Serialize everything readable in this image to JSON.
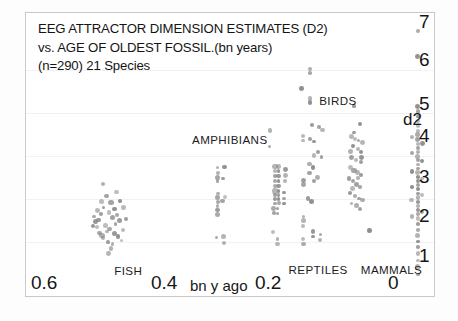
{
  "figure": {
    "title_lines": [
      "EEG ATTRACTOR  DIMENSION ESTIMATES (D2)",
      "vs. AGE OF OLDEST FOSSIL.(bn years)",
      "(n=290) 21 Species"
    ]
  },
  "axes": {
    "y_ticks": [
      "7",
      "6",
      "5",
      "4",
      "3",
      "2",
      "1"
    ],
    "y_axis_label": "d2",
    "x_ticks": [
      "0.6",
      "0.4",
      "0.2",
      "0"
    ],
    "x_axis_title": "bn y ago"
  },
  "group_labels": [
    {
      "name": "FISH",
      "text": "FISH"
    },
    {
      "name": "AMPHIBIANS",
      "text": "AMPHIBIANS"
    },
    {
      "name": "REPTILES",
      "text": "REPTILES"
    },
    {
      "name": "BIRDS",
      "text": "BIRDS"
    },
    {
      "name": "MAMMALS",
      "text": "MAMMALS"
    }
  ],
  "chart_data": {
    "type": "scatter",
    "title": "EEG ATTRACTOR  DIMENSION ESTIMATES (D2) vs. AGE OF OLDEST FOSSIL.(bn years)",
    "subtitle": "(n=290) 21 Species",
    "xlabel": "bn y ago",
    "ylabel": "d2",
    "xlim": [
      0.66,
      -0.02
    ],
    "ylim": [
      0.55,
      7.45
    ],
    "x_reversed": true,
    "grid": "faint-horizontal",
    "legend": "none (in-plot group labels)",
    "n_total": 290,
    "n_species": 21,
    "point_color": "#8a8a8a",
    "series": [
      {
        "name": "FISH",
        "label_x": 0.512,
        "label_y": 1.18,
        "points": [
          [
            0.533,
            3.3
          ],
          [
            0.527,
            3.02
          ],
          [
            0.519,
            2.86
          ],
          [
            0.513,
            2.7
          ],
          [
            0.509,
            2.56
          ],
          [
            0.505,
            2.42
          ],
          [
            0.522,
            2.62
          ],
          [
            0.516,
            2.5
          ],
          [
            0.531,
            2.74
          ],
          [
            0.536,
            2.58
          ],
          [
            0.54,
            2.44
          ],
          [
            0.528,
            2.3
          ],
          [
            0.521,
            2.22
          ],
          [
            0.514,
            2.12
          ],
          [
            0.507,
            2.04
          ],
          [
            0.501,
            1.94
          ],
          [
            0.517,
            1.86
          ],
          [
            0.524,
            1.9
          ],
          [
            0.532,
            2.0
          ],
          [
            0.538,
            2.12
          ],
          [
            0.543,
            2.26
          ],
          [
            0.545,
            2.4
          ],
          [
            0.535,
            2.88
          ],
          [
            0.541,
            2.66
          ],
          [
            0.51,
            3.12
          ],
          [
            0.504,
            2.9
          ],
          [
            0.498,
            2.74
          ],
          [
            0.512,
            2.34
          ],
          [
            0.526,
            2.16
          ],
          [
            0.534,
            2.06
          ],
          [
            0.519,
            1.74
          ],
          [
            0.523,
            1.62
          ],
          [
            0.547,
            2.52
          ],
          [
            0.549,
            2.3
          ],
          [
            0.499,
            2.2
          ],
          [
            0.494,
            2.46
          ]
        ]
      },
      {
        "name": "AMPHIBIANS",
        "label_x": 0.383,
        "label_y": 4.36,
        "points": [
          [
            0.342,
            3.7
          ],
          [
            0.342,
            3.58
          ],
          [
            0.342,
            3.46
          ],
          [
            0.342,
            3.38
          ],
          [
            0.331,
            3.72
          ],
          [
            0.333,
            3.44
          ],
          [
            0.342,
            3.08
          ],
          [
            0.342,
            2.98
          ],
          [
            0.342,
            2.88
          ],
          [
            0.342,
            2.78
          ],
          [
            0.342,
            2.68
          ],
          [
            0.342,
            2.58
          ],
          [
            0.33,
            3.0
          ],
          [
            0.334,
            2.9
          ],
          [
            0.344,
            2.02
          ],
          [
            0.333,
            2.04
          ],
          [
            0.331,
            1.88
          ]
        ]
      },
      {
        "name": "REPTILES",
        "label_x": 0.223,
        "label_y": 1.2,
        "points": [
          [
            0.255,
            4.6
          ],
          [
            0.256,
            4.22
          ],
          [
            0.247,
            3.74
          ],
          [
            0.241,
            3.74
          ],
          [
            0.247,
            3.62
          ],
          [
            0.241,
            3.62
          ],
          [
            0.247,
            3.5
          ],
          [
            0.241,
            3.5
          ],
          [
            0.247,
            3.38
          ],
          [
            0.241,
            3.38
          ],
          [
            0.247,
            3.26
          ],
          [
            0.241,
            3.26
          ],
          [
            0.247,
            3.14
          ],
          [
            0.241,
            3.14
          ],
          [
            0.247,
            3.04
          ],
          [
            0.241,
            3.04
          ],
          [
            0.247,
            2.94
          ],
          [
            0.241,
            2.94
          ],
          [
            0.247,
            2.84
          ],
          [
            0.241,
            2.84
          ],
          [
            0.249,
            2.72
          ],
          [
            0.243,
            2.72
          ],
          [
            0.249,
            2.6
          ],
          [
            0.243,
            2.6
          ],
          [
            0.251,
            2.14
          ],
          [
            0.243,
            1.98
          ],
          [
            0.243,
            1.86
          ],
          [
            0.23,
            3.66
          ],
          [
            0.23,
            3.52
          ],
          [
            0.23,
            3.38
          ],
          [
            0.232,
            3.1
          ],
          [
            0.232,
            2.96
          ],
          [
            0.232,
            2.84
          ]
        ]
      },
      {
        "name": "BIRDS",
        "label_x": 0.172,
        "label_y": 5.3,
        "points": [
          [
            0.189,
            6.1
          ],
          [
            0.189,
            6.0
          ],
          [
            0.189,
            5.38
          ],
          [
            0.189,
            5.28
          ],
          [
            0.203,
            5.62
          ],
          [
            0.186,
            4.74
          ],
          [
            0.174,
            4.7
          ],
          [
            0.168,
            4.62
          ],
          [
            0.189,
            4.4
          ],
          [
            0.183,
            4.34
          ],
          [
            0.176,
            4.08
          ],
          [
            0.182,
            4.0
          ],
          [
            0.17,
            3.96
          ],
          [
            0.19,
            3.8
          ],
          [
            0.184,
            3.7
          ],
          [
            0.19,
            3.58
          ],
          [
            0.176,
            3.46
          ],
          [
            0.182,
            3.38
          ],
          [
            0.192,
            2.96
          ],
          [
            0.186,
            2.88
          ],
          [
            0.2,
            4.48
          ],
          [
            0.2,
            4.36
          ],
          [
            0.2,
            3.4
          ],
          [
            0.2,
            3.3
          ],
          [
            0.2,
            2.52
          ],
          [
            0.2,
            2.42
          ],
          [
            0.2,
            2.3
          ],
          [
            0.2,
            1.98
          ],
          [
            0.2,
            1.86
          ],
          [
            0.184,
            2.16
          ],
          [
            0.184,
            2.04
          ],
          [
            0.172,
            2.08
          ],
          [
            0.172,
            1.96
          ]
        ]
      },
      {
        "name": "MAMMALS",
        "label_x": 0.103,
        "label_y": 1.2,
        "points": [
          [
            0.116,
            5.2
          ],
          [
            0.106,
            4.76
          ],
          [
            0.12,
            4.46
          ],
          [
            0.114,
            4.4
          ],
          [
            0.108,
            4.36
          ],
          [
            0.102,
            4.32
          ],
          [
            0.118,
            4.22
          ],
          [
            0.11,
            4.16
          ],
          [
            0.104,
            4.08
          ],
          [
            0.12,
            3.96
          ],
          [
            0.112,
            3.9
          ],
          [
            0.104,
            3.84
          ],
          [
            0.122,
            3.7
          ],
          [
            0.116,
            3.64
          ],
          [
            0.11,
            3.58
          ],
          [
            0.104,
            3.52
          ],
          [
            0.124,
            3.44
          ],
          [
            0.118,
            3.38
          ],
          [
            0.112,
            3.3
          ],
          [
            0.106,
            3.24
          ],
          [
            0.122,
            3.1
          ],
          [
            0.114,
            3.02
          ],
          [
            0.108,
            2.96
          ],
          [
            0.102,
            2.92
          ],
          [
            0.12,
            2.84
          ],
          [
            0.112,
            2.78
          ],
          [
            0.106,
            2.7
          ],
          [
            0.118,
            3.2
          ],
          [
            0.11,
            3.46
          ],
          [
            0.104,
            3.96
          ],
          [
            0.122,
            4.1
          ],
          [
            0.116,
            4.56
          ],
          [
            0.09,
            2.18
          ]
        ]
      },
      {
        "name": "LIVING-EXTANT-COLUMN",
        "label_x": null,
        "label_y": null,
        "points": [
          [
            0.01,
            7.02
          ],
          [
            0.01,
            6.4
          ],
          [
            0.01,
            5.18
          ],
          [
            0.01,
            5.06
          ],
          [
            0.01,
            4.94
          ],
          [
            0.01,
            4.84
          ],
          [
            0.01,
            4.72
          ],
          [
            0.01,
            4.6
          ],
          [
            0.01,
            4.5
          ],
          [
            0.01,
            4.38
          ],
          [
            0.01,
            4.28
          ],
          [
            0.01,
            4.18
          ],
          [
            0.01,
            4.08
          ],
          [
            0.01,
            3.98
          ],
          [
            0.01,
            3.88
          ],
          [
            0.01,
            3.78
          ],
          [
            0.01,
            3.68
          ],
          [
            0.01,
            3.58
          ],
          [
            0.01,
            3.48
          ],
          [
            0.01,
            3.38
          ],
          [
            0.01,
            3.28
          ],
          [
            0.01,
            3.18
          ],
          [
            0.01,
            3.08
          ],
          [
            0.01,
            2.98
          ],
          [
            0.01,
            2.88
          ],
          [
            0.01,
            2.78
          ],
          [
            0.01,
            2.68
          ],
          [
            0.01,
            2.58
          ],
          [
            0.01,
            2.48
          ],
          [
            0.01,
            2.34
          ],
          [
            0.01,
            2.2
          ],
          [
            0.01,
            2.06
          ],
          [
            0.01,
            1.92
          ],
          [
            0.01,
            1.78
          ],
          [
            0.01,
            1.62
          ],
          [
            0.01,
            1.46
          ],
          [
            0.01,
            1.3
          ],
          [
            0.01,
            1.12
          ],
          [
            0.02,
            4.44
          ],
          [
            0.02,
            4.06
          ],
          [
            0.02,
            3.62
          ],
          [
            0.02,
            3.24
          ],
          [
            0.02,
            2.92
          ],
          [
            0.02,
            2.52
          ],
          [
            0.003,
            4.3
          ],
          [
            0.003,
            3.86
          ],
          [
            0.003,
            3.44
          ],
          [
            0.003,
            3.04
          ],
          [
            0.003,
            2.64
          ]
        ]
      }
    ]
  }
}
